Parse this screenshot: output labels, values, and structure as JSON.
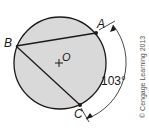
{
  "diagram": {
    "circle": {
      "fill": "#d9d9d9",
      "stroke": "#1a1a1a"
    },
    "points": {
      "A": {
        "label": "A"
      },
      "B": {
        "label": "B"
      },
      "C": {
        "label": "C"
      },
      "O": {
        "label": "O"
      }
    },
    "chords": [
      "BA",
      "BC"
    ],
    "arc_measure": {
      "label": "103°",
      "arc": "AC"
    },
    "copyright": "© Cengage Learning 2013"
  }
}
